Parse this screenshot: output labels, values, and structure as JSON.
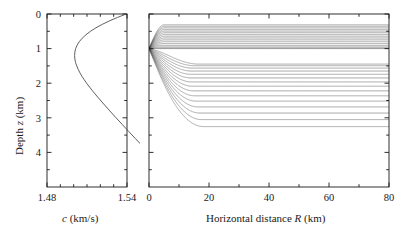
{
  "figure": {
    "title": "",
    "panels": [
      "sound-speed-profile",
      "ray-trace-diagram"
    ]
  },
  "chart_data": [
    {
      "type": "line",
      "name": "sound-speed-profile",
      "title": "",
      "xlabel": "c (km/s)",
      "xlabel_symbol": "c",
      "xlabel_units": "(km/s)",
      "ylabel": "Depth z (km)",
      "ylabel_prefix": "Depth ",
      "ylabel_symbol": "z",
      "ylabel_units": " (km)",
      "xlim": [
        1.48,
        1.54
      ],
      "ylim": [
        0,
        5
      ],
      "y_inverted": true,
      "grid": false,
      "legend": null,
      "xticks": [
        1.48,
        1.54
      ],
      "xtick_labels": [
        "1.48",
        "1.54"
      ],
      "xminor_ticks": [
        1.49,
        1.5,
        1.51,
        1.52,
        1.53
      ],
      "yticks": [
        0,
        1,
        2,
        3,
        4
      ],
      "ytick_labels": [
        "0",
        "1",
        "2",
        "3",
        "4"
      ],
      "yminor_ticks": [
        0.5,
        1.5,
        2.5,
        3.5,
        4.5
      ],
      "line_color": "#4d4d4d",
      "description": "Munk canonical sound speed profile; minimum near z = 1.2 km",
      "x": [
        0.0,
        0.1,
        0.2,
        0.3,
        0.4,
        0.5,
        0.6,
        0.7,
        0.8,
        0.9,
        1.0,
        1.1,
        1.2,
        1.3,
        1.4,
        1.5,
        1.6,
        1.7,
        1.8,
        1.9,
        2.0,
        2.2,
        2.4,
        2.6,
        2.8,
        3.0,
        3.2,
        3.4,
        3.6,
        3.8,
        4.0,
        4.2,
        4.4,
        4.6,
        4.75
      ],
      "values": [
        1.5394,
        1.5328,
        1.5268,
        1.5214,
        1.5167,
        1.5126,
        1.5092,
        1.5064,
        1.5042,
        1.5026,
        1.5015,
        1.5009,
        1.5007,
        1.5009,
        1.5014,
        1.5023,
        1.5034,
        1.5047,
        1.5062,
        1.5079,
        1.5097,
        1.5137,
        1.518,
        1.5225,
        1.5271,
        1.5318,
        1.5366,
        1.5414,
        1.5463,
        1.5512,
        1.5561,
        1.561,
        1.5659,
        1.5708,
        1.5744
      ],
      "munk_parameters": {
        "c1": 1.5007,
        "z_axis_km": 1.2,
        "epsilon": 0.00737,
        "B_km": 1.0
      }
    },
    {
      "type": "line",
      "name": "ray-trace-diagram",
      "title": "",
      "xlabel": "Horizontal distance R (km)",
      "xlabel_prefix": "Horizontal distance ",
      "xlabel_symbol": "R",
      "xlabel_units": " (km)",
      "ylabel": "",
      "xlim": [
        0,
        80
      ],
      "ylim": [
        0,
        5
      ],
      "y_inverted": true,
      "grid": false,
      "legend": null,
      "xticks": [
        0,
        20,
        40,
        60,
        80
      ],
      "xtick_labels": [
        "0",
        "20",
        "40",
        "60",
        "80"
      ],
      "xminor_ticks": [
        10,
        30,
        50,
        70
      ],
      "yticks": [
        0,
        1,
        2,
        3,
        4
      ],
      "ytick_labels": [],
      "yminor_ticks": [
        0.5,
        1.5,
        2.5,
        3.5,
        4.5
      ],
      "line_color": "#555555",
      "source_depth_km": 1.0,
      "source_range_km": 0.0,
      "n_rays": 31,
      "launch_angle_min_deg": -12,
      "launch_angle_max_deg": 12,
      "description": "Acoustic ray paths from a source at 1 km depth refracting in the Munk sound channel; convergence zones near 25 km and 46 km"
    }
  ],
  "colors": {
    "axis": "#1a1a1a",
    "ray": "#555555",
    "profile": "#4d4d4d",
    "background": "#ffffff"
  }
}
